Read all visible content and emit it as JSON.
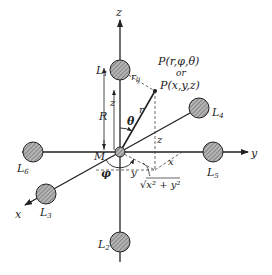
{
  "diagram": {
    "origin_label": "M",
    "axes": {
      "x": "x",
      "y": "y",
      "z": "z"
    },
    "conductors": [
      {
        "id": "L1",
        "letter": "L",
        "index": "1"
      },
      {
        "id": "L2",
        "letter": "L",
        "index": "2"
      },
      {
        "id": "L3",
        "letter": "L",
        "index": "3"
      },
      {
        "id": "L4",
        "letter": "L",
        "index": "4"
      },
      {
        "id": "L5",
        "letter": "L",
        "index": "5"
      },
      {
        "id": "L6",
        "letter": "L",
        "index": "6"
      }
    ],
    "point": {
      "line1": "P(r,φ,θ)",
      "line2": "or",
      "line3": "P(x,y,z)"
    },
    "labels": {
      "R": "R",
      "z_small": "z",
      "z_vertical": "z",
      "r": "r",
      "r_l1": "r",
      "r_l1_sub": "lj",
      "theta": "θ",
      "phi": "φ",
      "x_proj": "x",
      "y_proj": "y",
      "sqrt": "√x² + y²"
    },
    "colors": {
      "line": "#222222",
      "conductor_fill": "#9a9a9a",
      "hatch": "#555555",
      "background": "#ffffff"
    }
  }
}
